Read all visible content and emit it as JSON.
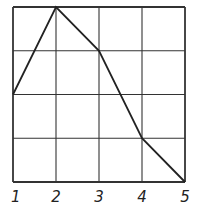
{
  "chart_data": {
    "type": "line",
    "title": "",
    "xlabel": "",
    "ylabel": "",
    "x": [
      1,
      2,
      3,
      4,
      5
    ],
    "categories": [
      "1",
      "2",
      "3",
      "4",
      "5"
    ],
    "values": [
      2,
      4,
      3,
      1,
      0
    ],
    "series": [
      {
        "name": "",
        "values": [
          2,
          4,
          3,
          1,
          0
        ]
      }
    ],
    "xlim": [
      1,
      5
    ],
    "ylim": [
      0,
      4
    ],
    "grid": true,
    "legend": null,
    "x_tick_labels": [
      "1",
      "2",
      "3",
      "4",
      "5"
    ],
    "y_tick_labels": []
  },
  "colors": {
    "line": "#222222",
    "grid": "#333333",
    "background": "#ffffff"
  }
}
